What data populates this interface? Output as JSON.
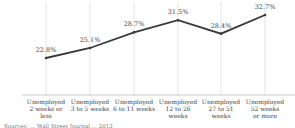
{
  "chart_data": {
    "type": "line",
    "title": "",
    "xlabel": "",
    "ylabel": "",
    "categories": [
      "Unemployed 2 weeks or less",
      "Unemployed 3 to 5 weeks",
      "Unemployed 6 to 11 weeks",
      "Unemployed 12 to 26 weeks",
      "Unemployed 27 to 51 weeks",
      "Unemployed 52 weeks or more"
    ],
    "category_lines": [
      [
        "Unemployed",
        "2 weeks or less"
      ],
      [
        "Unemployed",
        "3 to 5 weeks"
      ],
      [
        "Unemployed",
        "6 to 11 weeks"
      ],
      [
        "Unemployed",
        "12 to 26 weeks"
      ],
      [
        "Unemployed",
        "27 to 51 weeks"
      ],
      [
        "Unemployed",
        "52 weeks",
        "or more"
      ]
    ],
    "series": [
      {
        "name": "Share",
        "values": [
          22.8,
          25.1,
          28.7,
          31.5,
          28.4,
          32.7
        ]
      }
    ],
    "data_labels": [
      "22.8%",
      "25.1%",
      "28.7%",
      "31.5%",
      "28.4%",
      "32.7%"
    ],
    "grid": true,
    "legend": "none",
    "line_color": "#3a3a3a"
  },
  "footnote": "Sources: ... Wall Street Journal ... 2012"
}
